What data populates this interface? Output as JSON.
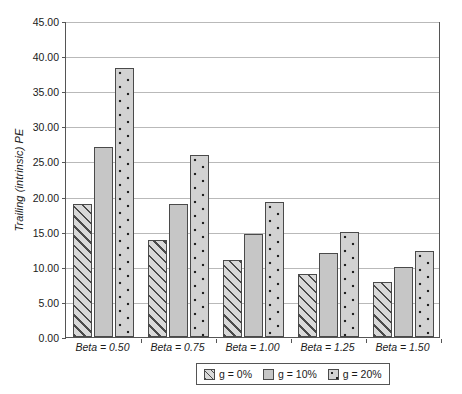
{
  "chart_data": {
    "type": "bar",
    "title": "",
    "xlabel": "",
    "ylabel": "Trailing (intrinsic) PE",
    "categories": [
      "Beta = 0.50",
      "Beta = 0.75",
      "Beta = 1.00",
      "Beta = 1.25",
      "Beta = 1.50"
    ],
    "series": [
      {
        "name": "g = 0%",
        "values": [
          18.9,
          13.8,
          10.9,
          9.0,
          7.8
        ]
      },
      {
        "name": "g = 10%",
        "values": [
          27.0,
          18.9,
          14.7,
          11.9,
          9.9
        ]
      },
      {
        "name": "g = 20%",
        "values": [
          38.3,
          25.9,
          19.2,
          14.9,
          12.2
        ]
      }
    ],
    "ylim": [
      0,
      45
    ],
    "ytick_step": 5,
    "ytick_labels": [
      "0.00",
      "5.00",
      "10.00",
      "15.00",
      "20.00",
      "25.00",
      "30.00",
      "35.00",
      "40.00",
      "45.00"
    ],
    "grid": true,
    "legend_position": "bottom"
  },
  "colors": {
    "axis": "#555555",
    "gridline": "#b9b9b9",
    "bar_outline": "#4a4a4a",
    "series_0_fill": "#d9d9d9",
    "series_1_fill": "#c6c6c6",
    "series_2_fill": "#d2d2d2",
    "background": "#ffffff"
  }
}
